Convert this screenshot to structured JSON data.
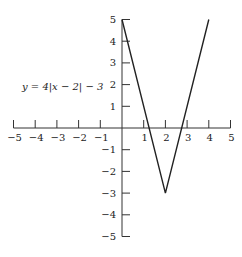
{
  "chart_data": {
    "type": "line",
    "title": "",
    "annotation": "y = 4|x − 2| − 3",
    "xlabel": "",
    "ylabel": "",
    "xlim": [
      -5,
      5
    ],
    "ylim": [
      -5,
      5
    ],
    "grid": false,
    "x_ticks": [
      -5,
      -4,
      -3,
      -2,
      -1,
      1,
      2,
      3,
      4,
      5
    ],
    "y_ticks": [
      5,
      4,
      3,
      2,
      1,
      -1,
      -2,
      -3,
      -4,
      -5
    ],
    "series": [
      {
        "name": "y = 4|x − 2| − 3",
        "x": [
          0,
          2,
          4
        ],
        "y": [
          5,
          -3,
          5
        ]
      }
    ]
  },
  "labels": {
    "equation": "y = 4|x − 2| − 3",
    "x_tick_labels": [
      "−5",
      "−4",
      "−3",
      "−2",
      "−1",
      "1",
      "2",
      "3",
      "4",
      "5"
    ],
    "y_tick_labels": [
      "5",
      "4",
      "3",
      "2",
      "1",
      "−1",
      "−2",
      "−3",
      "−4",
      "−5"
    ]
  }
}
